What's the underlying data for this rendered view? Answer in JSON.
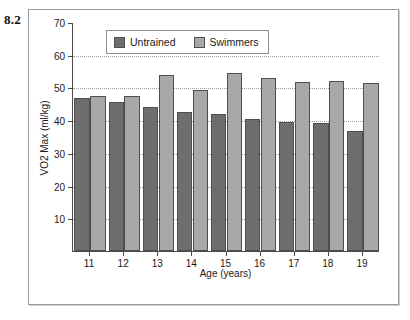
{
  "figure": {
    "number": "8.2"
  },
  "chart_data": {
    "type": "bar",
    "title": "",
    "xlabel": "Age (years)",
    "ylabel": "VO2 Max (ml/kg)",
    "categories": [
      "11",
      "12",
      "13",
      "14",
      "15",
      "16",
      "17",
      "18",
      "19"
    ],
    "series": [
      {
        "name": "Untrained",
        "color": "#6e6e6e",
        "values": [
          46.7,
          45.6,
          44.1,
          42.6,
          41.8,
          40.5,
          39.3,
          39.2,
          36.6
        ]
      },
      {
        "name": "Swimmers",
        "color": "#a8a8a8",
        "values": [
          47.5,
          47.5,
          53.9,
          49.1,
          54.3,
          52.8,
          51.7,
          52.0,
          51.3
        ]
      }
    ],
    "ylim": [
      0,
      70
    ],
    "yticks": [
      10,
      20,
      30,
      40,
      50,
      60,
      70
    ],
    "ytick_labels": [
      "10",
      "20",
      "30",
      "40",
      "50",
      "60",
      "70"
    ],
    "grid": true,
    "legend_position": "top-left"
  },
  "legend": {
    "entries": [
      {
        "label": "Untrained",
        "swatch": "untrained-swatch"
      },
      {
        "label": "Swimmers",
        "swatch": "swimmers-swatch"
      }
    ]
  }
}
